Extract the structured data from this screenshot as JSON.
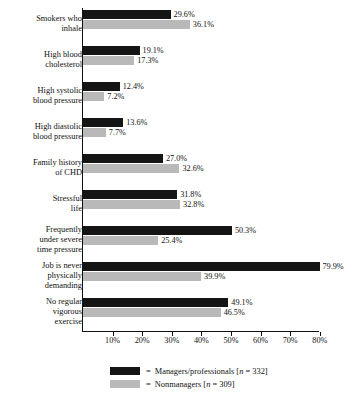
{
  "chart_data": {
    "type": "bar",
    "orientation": "horizontal",
    "title": "",
    "xlabel": "",
    "ylabel": "",
    "xlim": [
      0,
      82
    ],
    "grid": false,
    "legend_position": "bottom",
    "tick_labels": [
      "10%",
      "20%",
      "30%",
      "40%",
      "50%",
      "60%",
      "70%",
      "80%"
    ],
    "tick_values": [
      10,
      20,
      30,
      40,
      50,
      60,
      70,
      80
    ],
    "categories": [
      "Smokers who\ninhale",
      "High blood\ncholesterol",
      "High systolic\nblood pressure",
      "High diastolic\nblood pressure",
      "Family history\nof CHD",
      "Stressful\nlife",
      "Frequently\nunder severe\ntime pressure",
      "Job is never\nphysically\ndemanding",
      "No regular\nvigorous\nexercise"
    ],
    "series": [
      {
        "name": "Managers/professionals",
        "n": "332",
        "legend_label": "Managers/professionals [n = 332]",
        "color": "#151515",
        "values": [
          29.6,
          19.1,
          12.4,
          13.6,
          27.0,
          31.8,
          50.3,
          79.9,
          49.1
        ],
        "value_labels": [
          "29.6%",
          "19.1%",
          "12.4%",
          "13.6%",
          "27.0%",
          "31.8%",
          "50.3%",
          "79.9%",
          "49.1%"
        ]
      },
      {
        "name": "Nonmanagers",
        "n": "309",
        "legend_label": "Nonmanagers [n = 309]",
        "color": "#b9b9b9",
        "values": [
          36.1,
          17.3,
          7.2,
          7.7,
          32.6,
          32.8,
          25.4,
          39.9,
          46.5
        ],
        "value_labels": [
          "36.1%",
          "17.3%",
          "7.2%",
          "7.7%",
          "32.6%",
          "32.8%",
          "25.4%",
          "39.9%",
          "46.5%"
        ]
      }
    ]
  },
  "legend": {
    "equals": "=",
    "rows": [
      {
        "label_prefix": "Managers/professionals [",
        "n_symbol": "n",
        "label_suffix": " = 332]"
      },
      {
        "label_prefix": "Nonmanagers [",
        "n_symbol": "n",
        "label_suffix": " = 309]"
      }
    ]
  },
  "caption": {
    "remnant": ""
  }
}
